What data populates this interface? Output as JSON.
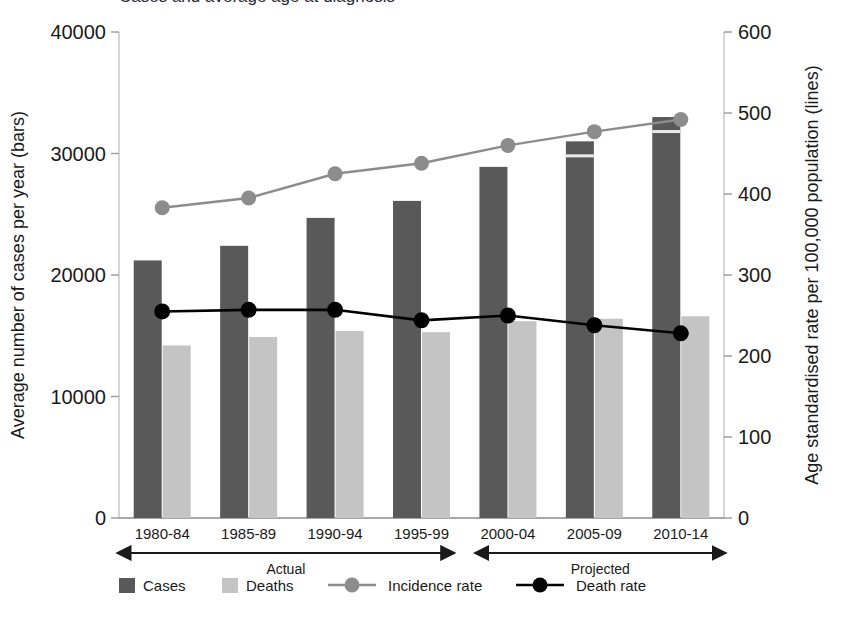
{
  "figure": {
    "title_clipped": "Cases and average age at diagnosis",
    "background": "#ffffff"
  },
  "colors": {
    "cases_bar": "#595959",
    "deaths_bar": "#c4c4c4",
    "incidence_line": "#8c8c8c",
    "death_line": "#000000",
    "axis": "#b0b0b0",
    "text": "#1a1a1a"
  },
  "axes": {
    "left": {
      "title": "Average number of cases per year (bars)",
      "ticks": [
        "0",
        "10000",
        "20000",
        "30000",
        "40000"
      ],
      "min": 0,
      "max": 40000
    },
    "right": {
      "title": "Age standardised rate per 100,000 population (lines)",
      "ticks": [
        "0",
        "100",
        "200",
        "300",
        "400",
        "500",
        "600"
      ],
      "min": 0,
      "max": 600
    },
    "bottom": {
      "categories": [
        "1980-84",
        "1985-89",
        "1990-94",
        "1995-99",
        "2000-04",
        "2005-09",
        "2010-14"
      ],
      "phases": [
        {
          "label": "Actual",
          "span": [
            0,
            3
          ]
        },
        {
          "label": "Projected",
          "span": [
            4,
            6
          ]
        }
      ]
    }
  },
  "legend": {
    "items": [
      {
        "label": "Cases",
        "marker": "bar-swatch",
        "color": "#595959"
      },
      {
        "label": "Deaths",
        "marker": "bar-swatch",
        "color": "#c4c4c4"
      },
      {
        "label": "Incidence rate",
        "marker": "line-dot",
        "color": "#8c8c8c"
      },
      {
        "label": "Death rate",
        "marker": "line-dot",
        "color": "#000000"
      }
    ]
  },
  "chart_data": {
    "type": "bar",
    "title": "Cases and average age at diagnosis",
    "xlabel": "",
    "ylabel": "Average number of cases per year (bars)",
    "y2label": "Age standardised rate per 100,000 population (lines)",
    "categories": [
      "1980-84",
      "1985-89",
      "1990-94",
      "1995-99",
      "2000-04",
      "2005-09",
      "2010-14"
    ],
    "ylim": [
      0,
      40000
    ],
    "y2lim": [
      0,
      600
    ],
    "grid": false,
    "legend_position": "bottom",
    "series": [
      {
        "name": "Cases",
        "type": "bar",
        "axis": "left",
        "color": "#595959",
        "values": [
          21200,
          22400,
          24700,
          26100,
          28900,
          31000,
          33000
        ]
      },
      {
        "name": "Deaths",
        "type": "bar",
        "axis": "left",
        "color": "#c4c4c4",
        "values": [
          14200,
          14900,
          15400,
          15300,
          16200,
          16400,
          16600
        ]
      },
      {
        "name": "Incidence rate",
        "type": "line",
        "axis": "right",
        "color": "#8c8c8c",
        "values": [
          383,
          395,
          425,
          438,
          460,
          477,
          492
        ]
      },
      {
        "name": "Death rate",
        "type": "line",
        "axis": "right",
        "color": "#000000",
        "values": [
          255,
          257,
          257,
          244,
          250,
          238,
          228
        ]
      }
    ],
    "annotations": [
      {
        "text": "Actual",
        "categories": [
          "1980-84",
          "1995-99"
        ]
      },
      {
        "text": "Projected",
        "categories": [
          "2000-04",
          "2010-14"
        ]
      }
    ]
  }
}
